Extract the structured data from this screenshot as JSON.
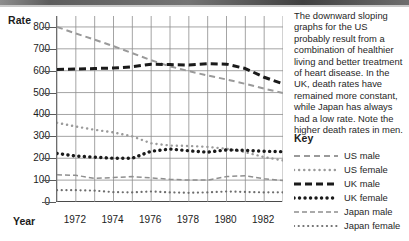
{
  "chart_data": {
    "type": "line",
    "title": "",
    "ylabel": "Rate",
    "xlabel": "Year",
    "ylim": [
      0,
      850
    ],
    "yticks": [
      0,
      100,
      200,
      300,
      400,
      500,
      600,
      700,
      800
    ],
    "xlim": [
      1971,
      1983
    ],
    "x": [
      1971,
      1972,
      1973,
      1974,
      1975,
      1976,
      1977,
      1978,
      1979,
      1980,
      1981,
      1982,
      1983
    ],
    "xticks": [
      1972,
      1974,
      1976,
      1978,
      1980,
      1982
    ],
    "xticklabels": [
      "1972",
      "1974",
      "1976",
      "1978",
      "1980",
      "1982"
    ],
    "grid": true,
    "legend_position": "right",
    "series": [
      {
        "name": "US male",
        "style": "dashed-light",
        "color": "#9a9a9a",
        "values": [
          800,
          770,
          742,
          712,
          680,
          648,
          620,
          598,
          578,
          560,
          540,
          518,
          498
        ]
      },
      {
        "name": "US female",
        "style": "dotted-light",
        "color": "#9a9a9a",
        "values": [
          362,
          345,
          330,
          318,
          300,
          268,
          258,
          256,
          252,
          243,
          228,
          205,
          190
        ]
      },
      {
        "name": "UK male",
        "style": "dashed-bold",
        "color": "#1a1a1a",
        "values": [
          606,
          608,
          610,
          612,
          618,
          630,
          628,
          626,
          632,
          630,
          610,
          570,
          540
        ]
      },
      {
        "name": "UK female",
        "style": "dotted-bold",
        "color": "#1a1a1a",
        "values": [
          222,
          210,
          205,
          200,
          200,
          232,
          242,
          234,
          228,
          238,
          236,
          232,
          230
        ]
      },
      {
        "name": "Japan male",
        "style": "dashed-thin",
        "color": "#8f8f8f",
        "values": [
          124,
          122,
          108,
          112,
          116,
          110,
          104,
          100,
          100,
          116,
          120,
          106,
          98
        ]
      },
      {
        "name": "Japan female",
        "style": "dotted-thin",
        "color": "#6e6e6e",
        "values": [
          54,
          54,
          52,
          45,
          44,
          48,
          44,
          42,
          44,
          48,
          46,
          44,
          44
        ]
      }
    ]
  },
  "sidebar": {
    "blurb": "The downward sloping graphs for the US probably result from a combination of healthier living and better treatment of heart disease. In the UK, death rates have remained more constant, while Japan has always had a low rate. Note the higher death rates in men.",
    "key_title": "Key"
  }
}
